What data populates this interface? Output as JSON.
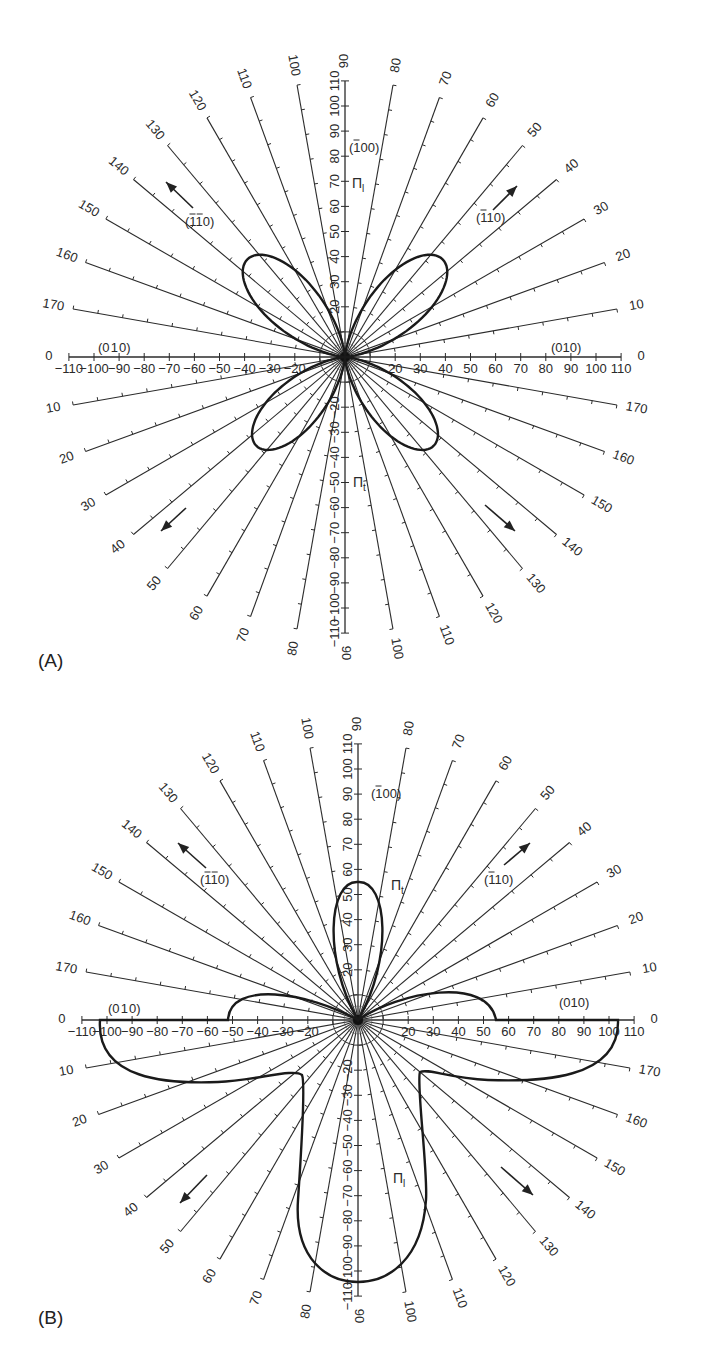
{
  "chart_data": [
    {
      "panel": "(A)",
      "type": "polar",
      "radial_axis": {
        "min": -110,
        "max": 110,
        "major_step": 10,
        "tick_labels": [
          "-110",
          "-100",
          "-90",
          "-80",
          "-70",
          "-60",
          "-50",
          "-40",
          "-30",
          "-20",
          "20",
          "30",
          "40",
          "50",
          "60",
          "70",
          "80",
          "90",
          "100",
          "110"
        ]
      },
      "angular_spokes_deg": [
        0,
        10,
        20,
        30,
        40,
        50,
        60,
        70,
        80,
        90,
        100,
        110,
        120,
        130,
        140,
        150,
        160,
        170
      ],
      "direction_labels": {
        "right": "(010)",
        "left": "(0ī0)",
        "top": "(ī00)",
        "upper_right": "(ī10)",
        "upper_left": "(īī0)"
      },
      "curve_labels": {
        "upper": "Πl",
        "lower": "Πt"
      },
      "series": [
        {
          "name": "lobe upper-right",
          "direction_deg": 45,
          "peak_radius": 55
        },
        {
          "name": "lobe upper-left",
          "direction_deg": 135,
          "peak_radius": 55
        },
        {
          "name": "lobe lower-left",
          "direction_deg": 225,
          "peak_radius": 50
        },
        {
          "name": "lobe lower-right",
          "direction_deg": 315,
          "peak_radius": 50
        }
      ],
      "arrows": [
        "upper-left (pointing out along 135°)",
        "upper-right (pointing out along 45°)",
        "lower-left (pointing out along 225°)",
        "lower-right (pointing out along 315°)"
      ]
    },
    {
      "panel": "(B)",
      "type": "polar",
      "radial_axis": {
        "min": -110,
        "max": 110,
        "major_step": 10
      },
      "angular_spokes_deg": [
        0,
        10,
        20,
        30,
        40,
        50,
        60,
        70,
        80,
        90,
        100,
        110,
        120,
        130,
        140,
        150,
        160,
        170
      ],
      "direction_labels": {
        "right": "(010)",
        "left": "(0ī0)",
        "top": "(ī00)",
        "upper_right": "(ī10)",
        "upper_left": "(īī0)"
      },
      "curve_labels": {
        "upper": "Πt",
        "lower": "Πl"
      },
      "series": [
        {
          "name": "Πt",
          "description": "single lobe pointing up",
          "peak_radius": 55
        },
        {
          "name": "Πl",
          "description": "lobes left and right along 0° axis and down",
          "radius_right_on_axis": 103,
          "radius_left_on_axis": 103,
          "radius_down": 110,
          "small_upper_lobes_radius": 55
        }
      ]
    }
  ],
  "labels": {
    "panel_a": "(A)",
    "panel_b": "(B)",
    "pi_l": "Π",
    "pi_l_sub": "l",
    "pi_t": "Π",
    "pi_t_sub": "t",
    "dir_010": "(010)",
    "dir_0m10": "(0̅0)",
    "dir_m100": "(̅0 0)",
    "dir_m110": "(̅110)",
    "dir_m1m10": "(̅̅0)"
  }
}
